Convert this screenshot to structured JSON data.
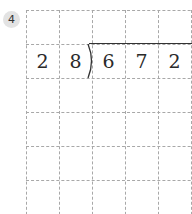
{
  "problem": {
    "number": "4",
    "type": "long-division",
    "divisor": [
      "2",
      "8"
    ],
    "dividend": [
      "6",
      "7",
      "2"
    ]
  },
  "grid": {
    "columns": 5,
    "rows_visible": 6,
    "line_color": "#a8a8a8",
    "line_style": "dashed"
  },
  "colors": {
    "badge_bg": "#e3e3e3",
    "text": "#2a2a2a"
  }
}
